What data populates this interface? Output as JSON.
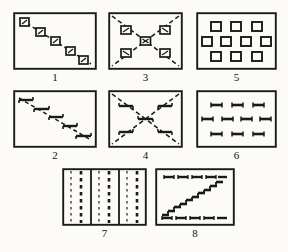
{
  "figure": {
    "background_color": "#fcfbf8",
    "ink_color": "#1a1a1a",
    "width": 288,
    "height": 252,
    "panel_count": 8
  },
  "panels": [
    {
      "id": "panel-1",
      "label": "1",
      "description": "rectangle with descending dashed diagonal line carrying five small outlined squares",
      "x": 13,
      "y": 12,
      "w": 84,
      "h": 58,
      "label_x": 13,
      "label_y": 71,
      "label_w": 84,
      "marker": "square",
      "pattern": "diagonal-descending",
      "marker_count": 5
    },
    {
      "id": "panel-3",
      "label": "3",
      "description": "rectangle with dashed X formed by both diagonals, five small outlined squares on the diagonals",
      "x": 108,
      "y": 12,
      "w": 75,
      "h": 58,
      "label_x": 108,
      "label_y": 71,
      "label_w": 75,
      "marker": "square",
      "pattern": "x-cross",
      "marker_count": 5
    },
    {
      "id": "panel-5",
      "label": "5",
      "description": "rectangle with ten small outlined squares arranged 3-4-3 in three rows",
      "x": 196,
      "y": 12,
      "w": 81,
      "h": 58,
      "label_x": 196,
      "label_y": 71,
      "label_w": 81,
      "marker": "square",
      "pattern": "grid-3-4-3",
      "marker_count": 10
    },
    {
      "id": "panel-2",
      "label": "2",
      "description": "rectangle with descending staircase of short horizontal dashes joined by dashed segments",
      "x": 13,
      "y": 90,
      "w": 84,
      "h": 58,
      "label_x": 13,
      "label_y": 149,
      "label_w": 84,
      "marker": "dash",
      "pattern": "diagonal-descending",
      "marker_count": 5
    },
    {
      "id": "panel-4",
      "label": "4",
      "description": "rectangle with dashed X formed by both diagonals, five short horizontal dashes on the diagonals",
      "x": 108,
      "y": 90,
      "w": 75,
      "h": 58,
      "label_x": 108,
      "label_y": 149,
      "label_w": 75,
      "marker": "dash",
      "pattern": "x-cross",
      "marker_count": 5
    },
    {
      "id": "panel-6",
      "label": "6",
      "description": "rectangle with ten short horizontal dashes arranged 3-4-3 in three rows",
      "x": 196,
      "y": 90,
      "w": 81,
      "h": 58,
      "label_x": 196,
      "label_y": 149,
      "label_w": 81,
      "marker": "dash",
      "pattern": "grid-3-4-3",
      "marker_count": 10
    },
    {
      "id": "panel-7",
      "label": "7",
      "description": "rectangle filled with alternating thin dotted and thick dashed vertical lines, grouped by two solid vertical rules",
      "x": 62,
      "y": 168,
      "w": 85,
      "h": 58,
      "label_x": 62,
      "label_y": 227,
      "label_w": 85,
      "marker": "vertical-dashed-line",
      "pattern": "vertical-stripes",
      "marker_count": 9
    },
    {
      "id": "panel-8",
      "label": "8",
      "description": "rectangle with rising staircase of short dashes from lower-left to upper-right plus rows of dashes along top and bottom",
      "x": 155,
      "y": 168,
      "w": 80,
      "h": 58,
      "label_x": 155,
      "label_y": 227,
      "label_w": 80,
      "marker": "dash",
      "pattern": "staircase-ascending",
      "marker_count": 14
    }
  ]
}
